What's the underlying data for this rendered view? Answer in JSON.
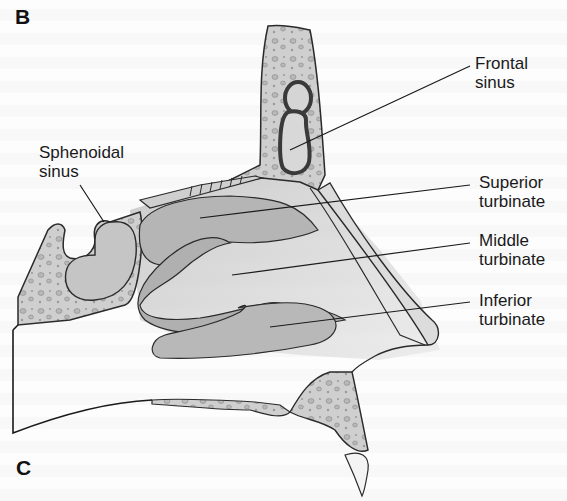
{
  "figure": {
    "panel_top": "B",
    "panel_bottom": "C",
    "labels": {
      "frontal_sinus": [
        "Frontal",
        "sinus"
      ],
      "sphenoidal_sinus": [
        "Sphenoidal",
        "sinus"
      ],
      "superior_turbinate": [
        "Superior",
        "turbinate"
      ],
      "middle_turbinate": [
        "Middle",
        "turbinate"
      ],
      "inferior_turbinate": [
        "Inferior",
        "turbinate"
      ]
    },
    "colors": {
      "bone": "#c9c9c9",
      "turbinate": "#b5b5b5",
      "outline": "#2a2a2a",
      "background": "#fdfdfd"
    }
  }
}
